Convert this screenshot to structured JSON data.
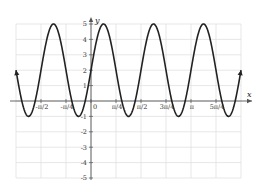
{
  "chart_data": {
    "type": "line",
    "title": "",
    "function": "y = 3 sin(4x) + 2",
    "xlabel": "x",
    "ylabel": "y",
    "xlim": [
      "-3π/4",
      "3π/2"
    ],
    "ylim": [
      -5,
      5
    ],
    "grid": true,
    "x_tick_labels": [
      "-π/2",
      "-π/4",
      "0",
      "π/4",
      "π/2",
      "3π/4",
      "π",
      "5π/4"
    ],
    "y_tick_labels": [
      "5",
      "4",
      "3",
      "2",
      "1",
      "-1",
      "-2",
      "-3",
      "-4",
      "-5"
    ],
    "series": [
      {
        "name": "y = 3 sin(4x) + 2",
        "amplitude": 3,
        "midline": 2,
        "period": "π/2",
        "max": 5,
        "min": -1,
        "arrows_at_ends": true
      }
    ],
    "colors": {
      "curve": "#222222",
      "grid": "#dddddd",
      "axis": "#555555"
    }
  }
}
